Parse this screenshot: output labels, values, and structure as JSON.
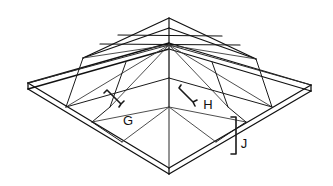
{
  "diagram": {
    "type": "isometric-hip-roof",
    "background_color": "#ffffff",
    "line_color": "#1a1a1a",
    "callouts": [
      {
        "id": "callout-g",
        "label": "G",
        "label_x": 128,
        "label_y": 125,
        "bracket_path": "M 104 93 L 107 90 L 121 104 L 124 101 M 121 104 L 119 107",
        "description": "Left roof plane field area callout"
      },
      {
        "id": "callout-h",
        "label": "H",
        "label_x": 208,
        "label_y": 109,
        "bracket_path": "M 181 85 L 179 88 L 193 102 L 197 100 M 193 102 L 195 106",
        "description": "Right roof plane field area callout"
      },
      {
        "id": "callout-j",
        "label": "J",
        "label_x": 244,
        "label_y": 148,
        "bracket_path": "M 231 117 L 236 117 L 236 154 L 231 154",
        "description": "Fascia edge thickness callout"
      }
    ],
    "geometry": {
      "apex": {
        "x": 169,
        "y": 18
      },
      "corners": {
        "left": {
          "x": 28,
          "y": 83
        },
        "top": {
          "x": 169,
          "y": 43
        },
        "right": {
          "x": 311,
          "y": 85
        },
        "bottom": {
          "x": 169,
          "y": 168
        }
      },
      "center": {
        "x": 169,
        "y": 107
      },
      "edge_thickness_px": 6
    }
  }
}
